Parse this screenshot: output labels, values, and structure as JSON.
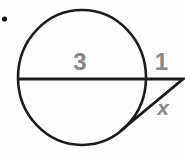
{
  "diagram": {
    "labels": {
      "chord": "3",
      "external_segment": "1",
      "tangent": "x"
    },
    "colors": {
      "line": "#1c1c1c",
      "label": "#878787",
      "bullet": "#111111",
      "background": "#fdfdfd"
    }
  }
}
